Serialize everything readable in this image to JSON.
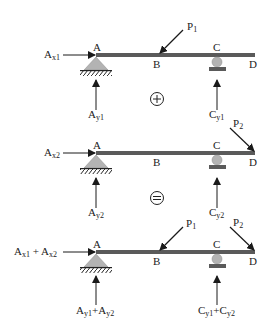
{
  "colors": {
    "beam": "#5a5a5a",
    "support": "#b3b3b3",
    "support_edge": "#8a8a8a",
    "arrow": "#1a1a1a",
    "text": "#222222"
  },
  "operators": {
    "plus": "+",
    "equals": "="
  },
  "diagrams": [
    {
      "name": "load-case-1",
      "points": {
        "A": "A",
        "B": "B",
        "C": "C",
        "D": "D"
      },
      "left_horizontal": {
        "main": "A",
        "sub": "x1"
      },
      "left_vertical": {
        "main": "A",
        "sub": "y1"
      },
      "right_vertical": {
        "main": "C",
        "sub": "y1"
      },
      "load_B": {
        "main": "P",
        "sub": "1"
      }
    },
    {
      "name": "load-case-2",
      "points": {
        "A": "A",
        "B": "B",
        "C": "C",
        "D": "D"
      },
      "left_horizontal": {
        "main": "A",
        "sub": "x2"
      },
      "left_vertical": {
        "main": "A",
        "sub": "y2"
      },
      "right_vertical": {
        "main": "C",
        "sub": "y2"
      },
      "load_D": {
        "main": "P",
        "sub": "2"
      }
    },
    {
      "name": "combined-load-case",
      "points": {
        "A": "A",
        "B": "B",
        "C": "C",
        "D": "D"
      },
      "left_horizontal": {
        "main1": "A",
        "sub1": "x1",
        "plus": " + ",
        "main2": "A",
        "sub2": "x2"
      },
      "left_vertical": {
        "main1": "A",
        "sub1": "y1",
        "plus": "+",
        "main2": "A",
        "sub2": "y2"
      },
      "right_vertical": {
        "main1": "C",
        "sub1": "y1",
        "plus": "+",
        "main2": "C",
        "sub2": "y2"
      },
      "load_B": {
        "main": "P",
        "sub": "1"
      },
      "load_D": {
        "main": "P",
        "sub": "2"
      }
    }
  ]
}
